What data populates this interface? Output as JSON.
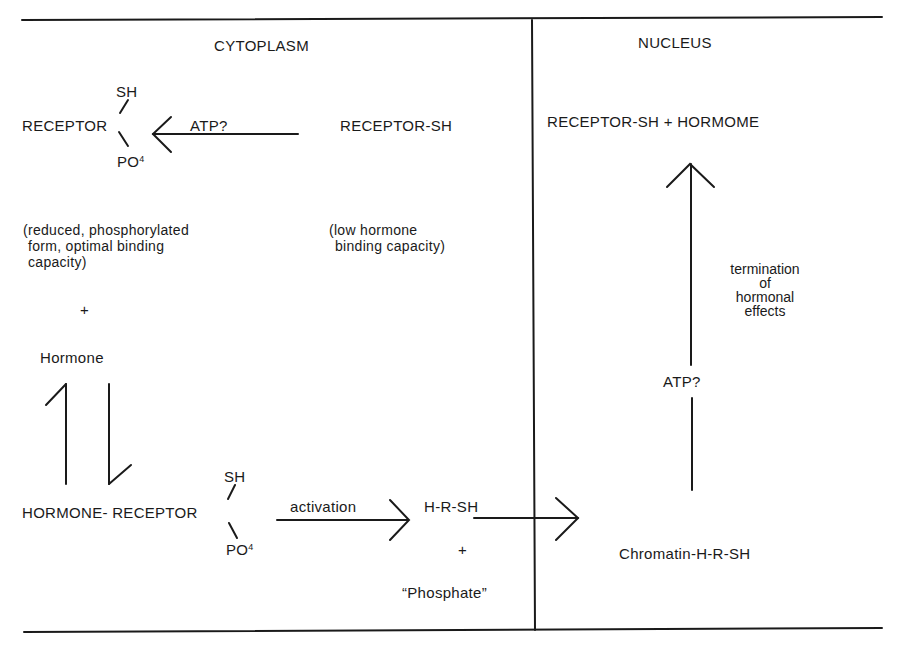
{
  "regions": {
    "cytoplasm": "CYTOPLASM",
    "nucleus": "NUCLEUS"
  },
  "cytoplasm": {
    "phospho_receptor": {
      "sh": "SH",
      "main": "RECEPTOR",
      "po": "PO",
      "po_sup": "4"
    },
    "atp_arrow_label": "ATP?",
    "receptor_sh": "RECEPTOR-SH",
    "phospho_desc": [
      "(reduced, phosphorylated",
      "form, optimal binding",
      "capacity)"
    ],
    "low_desc": [
      "(low hormone",
      "binding capacity)"
    ],
    "plus1": "+",
    "hormone": "Hormone",
    "complex": {
      "sh": "SH",
      "main": "HORMONE- RECEPTOR",
      "po": "PO",
      "po_sup": "4"
    },
    "activation_label": "activation",
    "hrsh": "H-R-SH",
    "plus2": "+",
    "phosphate": "“Phosphate”"
  },
  "nucleus": {
    "top_product": "RECEPTOR-SH + HORMOME",
    "termination": [
      "termination",
      "of",
      "hormonal",
      "effects"
    ],
    "atp_label": "ATP?",
    "chromatin": "Chromatin-H-R-SH"
  }
}
